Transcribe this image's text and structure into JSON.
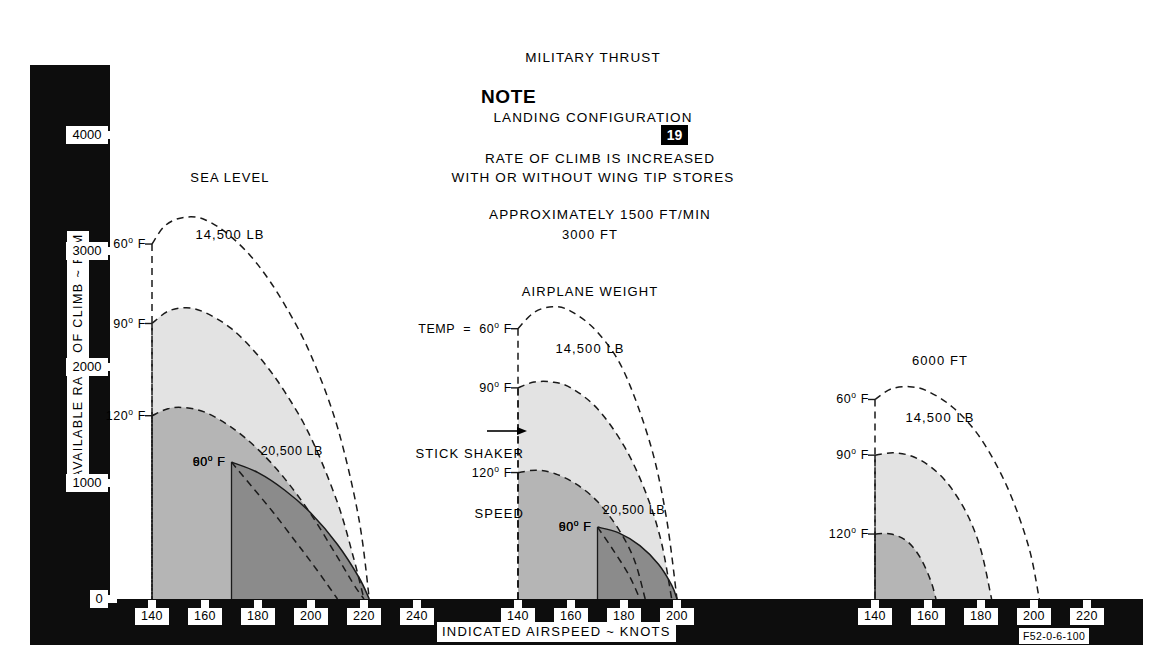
{
  "header": {
    "lines": [
      "MILITARY THRUST",
      "LANDING CONFIGURATION",
      "WITH OR WITHOUT WING TIP STORES"
    ],
    "note_word": "NOTE",
    "note_badge": "19",
    "note_lines": [
      "RATE OF CLIMB IS INCREASED",
      "APPROXIMATELY 1500 FT/MIN"
    ]
  },
  "axes": {
    "y_title": "AVAILABLE RATE OF CLIMB ~ FPM",
    "y_ticks": [
      "4000",
      "3000",
      "2000",
      "1000",
      "0"
    ],
    "x_title": "INDICATED AIRSPEED ~ KNOTS",
    "figure_code": "F52-0-6-100"
  },
  "annotations": {
    "stick_shaker_line1": "STICK SHAKER",
    "stick_shaker_line2": "SPEED",
    "temp_prefix": "TEMP  =  "
  },
  "chart_data": {
    "type": "line",
    "title": "MILITARY THRUST LANDING CONFIGURATION WITH OR WITHOUT WING TIP STORES",
    "xlabel": "INDICATED AIRSPEED ~ KNOTS",
    "ylabel": "AVAILABLE RATE OF CLIMB ~ FPM",
    "ylim": [
      0,
      4400
    ],
    "grid": false,
    "legend": "inline-curve-labels",
    "panels": [
      {
        "name": "sea-level",
        "title_lines": [
          "SEA LEVEL",
          "14,500 LB"
        ],
        "xlim": [
          130,
          250
        ],
        "x_ticks": [
          140,
          160,
          180,
          200,
          220,
          240
        ],
        "weight_labels": [
          {
            "text": "20,500 LB",
            "x": 181,
            "y": 1270
          }
        ],
        "series": [
          {
            "name": "14,500 LB  60 F",
            "label": "60° F",
            "weight": "14,500 LB",
            "temp": "60",
            "style": "dashed",
            "x": [
              140,
              145,
              152,
              160,
              170,
              180,
              190,
              200,
              210,
              218,
              222
            ],
            "y": [
              3060,
              3220,
              3290,
              3270,
              3120,
              2880,
              2540,
              2100,
              1480,
              700,
              0
            ]
          },
          {
            "name": "14,500 LB  90 F",
            "label": "90° F",
            "weight": "14,500 LB",
            "temp": "90",
            "style": "dashed",
            "fill": "#e3e3e3",
            "x": [
              140,
              146,
              153,
              160,
              170,
              180,
              190,
              200,
              210,
              216,
              220
            ],
            "y": [
              2375,
              2480,
              2510,
              2470,
              2330,
              2100,
              1790,
              1390,
              830,
              360,
              0
            ]
          },
          {
            "name": "14,500 LB  120 F",
            "label": "120° F",
            "weight": "14,500 LB",
            "temp": "120",
            "style": "dashed",
            "fill": "#b5b5b5",
            "x": [
              140,
              146,
              152,
              160,
              170,
              180,
              190,
              200,
              210,
              216,
              220
            ],
            "y": [
              1580,
              1640,
              1650,
              1610,
              1480,
              1290,
              1040,
              730,
              360,
              130,
              0
            ]
          },
          {
            "name": "20,500 LB  60 F",
            "label": "60° F",
            "weight": "20,500 LB",
            "temp": "60",
            "style": "solid",
            "fill": "#8b8b8b",
            "x": [
              170,
              180,
              190,
              200,
              210,
              218,
              222
            ],
            "y": [
              1180,
              1090,
              940,
              740,
              470,
              190,
              0
            ]
          },
          {
            "name": "20,500 LB  90 F",
            "label": "90° F",
            "weight": "20,500 LB",
            "temp": "90",
            "style": "dashed",
            "x": [
              170,
              178,
              186,
              194,
              200,
              206,
              210
            ],
            "y": [
              1180,
              960,
              740,
              500,
              320,
              130,
              0
            ]
          }
        ]
      },
      {
        "name": "3000-ft",
        "title_lines": [
          "3000 FT",
          "AIRPLANE WEIGHT",
          "14,500 LB"
        ],
        "xlim": [
          130,
          215
        ],
        "x_ticks": [
          140,
          160,
          180,
          200
        ],
        "weight_labels": [
          {
            "text": "20,500 LB",
            "x": 172,
            "y": 760
          }
        ],
        "series": [
          {
            "name": "14,500 LB  60 F",
            "label": "60° F",
            "weight": "14,500 LB",
            "temp": "60",
            "style": "dashed",
            "x": [
              140,
              146,
              153,
              160,
              170,
              180,
              190,
              196,
              200
            ],
            "y": [
              2330,
              2470,
              2520,
              2480,
              2300,
              1960,
              1330,
              700,
              0
            ]
          },
          {
            "name": "14,500 LB  90 F",
            "label": "90° F",
            "weight": "14,500 LB",
            "temp": "90",
            "style": "dashed",
            "fill": "#e3e3e3",
            "x": [
              140,
              146,
              153,
              160,
              170,
              180,
              188,
              194,
              198
            ],
            "y": [
              1820,
              1870,
              1870,
              1820,
              1640,
              1320,
              930,
              500,
              0
            ]
          },
          {
            "name": "14,500 LB  120 F",
            "label": "120° F",
            "weight": "14,500 LB",
            "temp": "120",
            "style": "dashed",
            "fill": "#b5b5b5",
            "x": [
              140,
              147,
              154,
              162,
              170,
              178,
              184,
              188
            ],
            "y": [
              1090,
              1110,
              1080,
              990,
              840,
              600,
              330,
              0
            ]
          },
          {
            "name": "20,500 LB  60 F",
            "label": "60° F",
            "weight": "20,500 LB",
            "temp": "60",
            "style": "solid",
            "fill": "#8b8b8b",
            "x": [
              170,
              178,
              186,
              193,
              198,
              200
            ],
            "y": [
              620,
              570,
              460,
              300,
              120,
              0
            ]
          },
          {
            "name": "20,500 LB  90 F",
            "label": "90° F",
            "weight": "20,500 LB",
            "temp": "90",
            "style": "dashed",
            "x": [
              170,
              176,
              182,
              186
            ],
            "y": [
              620,
              420,
              200,
              0
            ]
          }
        ]
      },
      {
        "name": "6000-ft",
        "title_lines": [
          "6000 FT",
          "14,500 LB"
        ],
        "xlim": [
          130,
          230
        ],
        "x_ticks": [
          140,
          160,
          180,
          200,
          220
        ],
        "weight_labels": [],
        "series": [
          {
            "name": "14,500 LB  60 F",
            "label": "60° F",
            "weight": "14,500 LB",
            "temp": "60",
            "style": "dashed",
            "x": [
              140,
              146,
              153,
              160,
              170,
              180,
              190,
              198,
              202
            ],
            "y": [
              1720,
              1810,
              1830,
              1790,
              1640,
              1380,
              960,
              450,
              0
            ]
          },
          {
            "name": "14,500 LB  90 F",
            "label": "90° F",
            "weight": "14,500 LB",
            "temp": "90",
            "style": "dashed",
            "fill": "#e3e3e3",
            "x": [
              140,
              147,
              154,
              161,
              168,
              175,
              180,
              184
            ],
            "y": [
              1240,
              1260,
              1230,
              1140,
              980,
              720,
              420,
              0
            ]
          },
          {
            "name": "14,500 LB  120 F",
            "label": "120° F",
            "weight": "14,500 LB",
            "temp": "120",
            "style": "dashed",
            "fill": "#b5b5b5",
            "x": [
              140,
              146,
              152,
              157,
              161,
              163
            ],
            "y": [
              560,
              560,
              500,
              360,
              160,
              0
            ]
          }
        ]
      }
    ]
  }
}
